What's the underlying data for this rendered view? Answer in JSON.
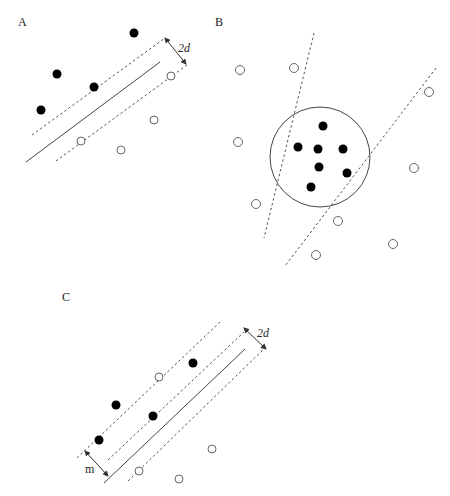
{
  "panels": {
    "A": {
      "label": "A",
      "margin_label": "2d",
      "filled_points": [
        [
          134,
          33
        ],
        [
          57,
          74
        ],
        [
          94,
          87
        ],
        [
          41,
          110
        ]
      ],
      "open_points": [
        [
          171,
          76
        ],
        [
          154,
          120
        ],
        [
          81,
          141
        ],
        [
          121,
          150
        ]
      ]
    },
    "B": {
      "label": "B",
      "filled_points": [
        [
          323,
          126
        ],
        [
          298,
          147
        ],
        [
          318,
          149
        ],
        [
          343,
          149
        ],
        [
          319,
          167
        ],
        [
          347,
          173
        ],
        [
          311,
          187
        ]
      ],
      "open_points": [
        [
          240,
          70
        ],
        [
          294,
          68
        ],
        [
          457,
          92
        ],
        [
          238,
          142
        ],
        [
          414,
          168
        ],
        [
          256,
          204
        ],
        [
          337,
          221
        ],
        [
          390,
          243
        ],
        [
          316,
          255
        ]
      ],
      "circle": {
        "cx": 320,
        "cy": 157,
        "r": 50
      }
    },
    "C": {
      "label": "C",
      "margin_label": "2d",
      "width_label": "m",
      "filled_points": [
        [
          193,
          363
        ],
        [
          116,
          405
        ],
        [
          153,
          416
        ],
        [
          99,
          440
        ]
      ],
      "open_points": [
        [
          159,
          377
        ],
        [
          212,
          449
        ],
        [
          139,
          471
        ],
        [
          179,
          479
        ]
      ]
    }
  }
}
